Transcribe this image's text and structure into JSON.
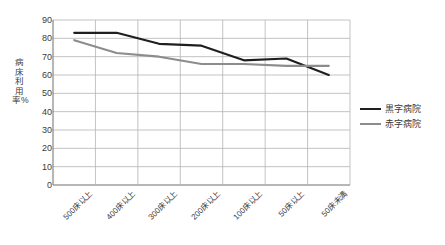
{
  "chart_data": {
    "type": "line",
    "title": "",
    "xlabel": "",
    "ylabel": "病床利用率%",
    "ylim": [
      0,
      90
    ],
    "ytick_step": 10,
    "yticks": [
      "90",
      "80",
      "70",
      "60",
      "50",
      "40",
      "30",
      "20",
      "10",
      "0"
    ],
    "grid": true,
    "legend_position": "right",
    "categories": [
      "500床以上",
      "400床以上",
      "300床以上",
      "200床以上",
      "100床以上",
      "50床以上",
      "50床未満"
    ],
    "series": [
      {
        "name": "黒字病院",
        "color": "#1f1f1f",
        "width": 2.1,
        "values": [
          83,
          83,
          77,
          76,
          68,
          69,
          60
        ]
      },
      {
        "name": "赤字病院",
        "color": "#8c8c8c",
        "width": 2.1,
        "values": [
          79,
          72,
          70,
          66,
          66,
          65,
          65
        ]
      }
    ]
  },
  "legend": {
    "items": [
      {
        "label": "黒字病院"
      },
      {
        "label": "赤字病院"
      }
    ]
  },
  "colors": {
    "series_profit": "#1f1f1f",
    "series_loss": "#8c8c8c",
    "grid": "#b4b4b4",
    "axis": "#6e6e6e",
    "text": "#3a3a3a",
    "background": "#ffffff"
  }
}
